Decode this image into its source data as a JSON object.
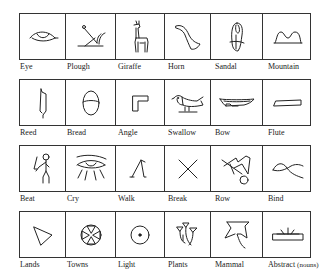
{
  "chart_title": "",
  "grid": {
    "columns": 6,
    "column_widths": [
      46,
      50,
      49,
      46,
      52,
      49
    ],
    "rows": [
      {
        "cells": [
          {
            "label": "Eye",
            "glyph": "eye-icon"
          },
          {
            "label": "Plough",
            "glyph": "plough-icon"
          },
          {
            "label": "Giraffe",
            "glyph": "giraffe-icon"
          },
          {
            "label": "Horn",
            "glyph": "horn-icon"
          },
          {
            "label": "Sandal",
            "glyph": "sandal-icon"
          },
          {
            "label": "Mountain",
            "glyph": "mountain-icon"
          }
        ]
      },
      {
        "cells": [
          {
            "label": "Reed",
            "glyph": "reed-icon"
          },
          {
            "label": "Bread",
            "glyph": "bread-icon"
          },
          {
            "label": "Angle",
            "glyph": "angle-icon"
          },
          {
            "label": "Swallow",
            "glyph": "swallow-icon"
          },
          {
            "label": "Bow",
            "glyph": "bow-icon"
          },
          {
            "label": "Flute",
            "glyph": "flute-icon"
          }
        ]
      },
      {
        "cells": [
          {
            "label": "Beat",
            "glyph": "beat-icon"
          },
          {
            "label": "Cry",
            "glyph": "cry-icon"
          },
          {
            "label": "Walk",
            "glyph": "walk-icon"
          },
          {
            "label": "Break",
            "glyph": "break-icon"
          },
          {
            "label": "Row",
            "glyph": "row-icon"
          },
          {
            "label": "Bind",
            "glyph": "bind-icon"
          }
        ]
      },
      {
        "cells": [
          {
            "label": "Lands",
            "glyph": "lands-icon"
          },
          {
            "label": "Towns",
            "glyph": "towns-icon"
          },
          {
            "label": "Light",
            "glyph": "light-icon"
          },
          {
            "label": "Plants",
            "glyph": "plants-icon"
          },
          {
            "label": "Mammal",
            "glyph": "mammal-icon"
          },
          {
            "label": "Abstract",
            "label_suffix": "(nouns)",
            "glyph": "abstract-icon"
          }
        ]
      }
    ]
  }
}
